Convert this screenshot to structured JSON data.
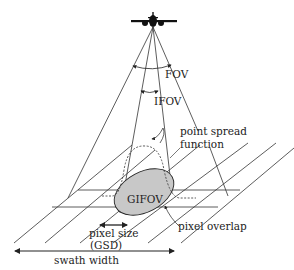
{
  "diagram": {
    "type": "remote-sensing-geometry",
    "labels": {
      "fov": "FOV",
      "ifov": "IFOV",
      "psf_line1": "point spread",
      "psf_line2": "function",
      "gifov": "GIFOV",
      "pixel_size_line1": "pixel size",
      "pixel_size_line2": "(GSD)",
      "pixel_overlap": "pixel overlap",
      "swath_width": "swath width"
    },
    "icons": {
      "sensor": "airplane-icon"
    },
    "colors": {
      "line": "#222222",
      "gifov_fill": "#c8c8c8",
      "background": "#ffffff"
    }
  }
}
